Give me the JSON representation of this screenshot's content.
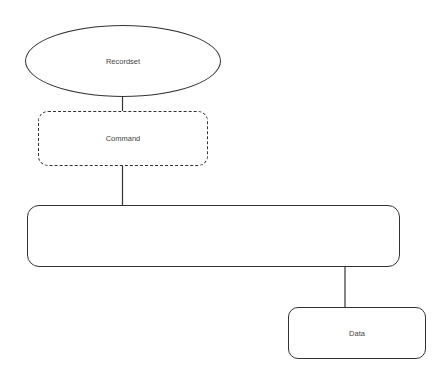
{
  "diagram": {
    "type": "hierarchy",
    "nodes": [
      {
        "id": "recordset",
        "label": "Recordset",
        "shape": "ellipse",
        "style": "solid"
      },
      {
        "id": "command",
        "label": "Command",
        "shape": "rounded-rectangle",
        "style": "dashed"
      },
      {
        "id": "connection",
        "label": "Connection",
        "shape": "rounded-rectangle",
        "style": "solid"
      },
      {
        "id": "data",
        "label": "Data",
        "shape": "rounded-rectangle",
        "style": "solid"
      }
    ],
    "edges": [
      {
        "from": "recordset",
        "to": "command"
      },
      {
        "from": "command",
        "to": "connection"
      },
      {
        "from": "connection",
        "to": "data"
      }
    ],
    "colors": {
      "stroke": "#333333",
      "text": "#444444",
      "background": "#ffffff"
    }
  }
}
